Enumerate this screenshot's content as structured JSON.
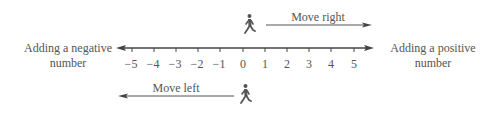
{
  "diagram": {
    "title": "",
    "number_line": {
      "min": -5,
      "max": 5,
      "ticks": [
        "−5",
        "−4",
        "−3",
        "−2",
        "−1",
        "0",
        "1",
        "2",
        "3",
        "4",
        "5"
      ],
      "color": "#444444"
    },
    "left_label": {
      "line1": "Adding a negative",
      "line2": "number"
    },
    "right_label": {
      "line1": "Adding a positive",
      "line2": "number"
    },
    "move_right": {
      "label": "Move right",
      "icon": "walking-person-icon",
      "direction": "right"
    },
    "move_left": {
      "label": "Move left",
      "icon": "walking-person-icon",
      "direction": "left"
    },
    "colors": {
      "text": "#555555",
      "line": "#444444",
      "figure": "#555555"
    }
  }
}
